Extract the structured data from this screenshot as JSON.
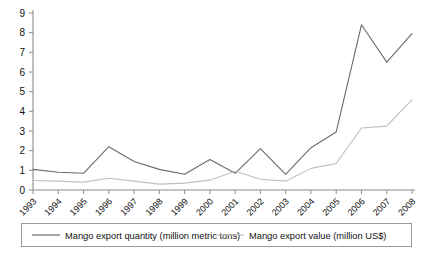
{
  "chart_data": {
    "type": "line",
    "title": "",
    "xlabel": "",
    "ylabel": "",
    "x": [
      "1993",
      "1994",
      "1995",
      "1996",
      "1997",
      "1998",
      "1999",
      "2000",
      "2001",
      "2002",
      "2003",
      "2004",
      "2005",
      "2006",
      "2007",
      "2008"
    ],
    "categories": [
      "1993",
      "1994",
      "1995",
      "1996",
      "1997",
      "1998",
      "1999",
      "2000",
      "2001",
      "2002",
      "2003",
      "2004",
      "2005",
      "2006",
      "2007",
      "2008"
    ],
    "series": [
      {
        "name": "Mango export quantity (million metric tons)",
        "color": "#6b6b6b",
        "values": [
          1.05,
          0.9,
          0.85,
          2.2,
          1.45,
          1.05,
          0.8,
          1.55,
          0.85,
          2.1,
          0.8,
          2.15,
          2.95,
          8.4,
          6.5,
          7.95
        ]
      },
      {
        "name": "Mango export value (million US$)",
        "color": "#bfbfbf",
        "values": [
          0.48,
          0.45,
          0.4,
          0.6,
          0.45,
          0.3,
          0.35,
          0.5,
          0.95,
          0.55,
          0.45,
          1.1,
          1.35,
          3.15,
          3.25,
          4.6
        ]
      }
    ],
    "ylim": [
      0,
      9
    ],
    "yticks": [
      "0",
      "1",
      "2",
      "3",
      "4",
      "5",
      "6",
      "7",
      "8",
      "9"
    ],
    "grid": false,
    "legend_position": "bottom"
  },
  "legend": {
    "entries": [
      {
        "label": "Mango export quantity (million metric tons)"
      },
      {
        "label": "Mango export value (million US$)"
      }
    ]
  },
  "colors": {
    "series_quantity": "#6b6b6b",
    "series_value": "#bfbfbf",
    "axis": "#8c8c8c",
    "text": "#111111",
    "background": "#ffffff"
  }
}
